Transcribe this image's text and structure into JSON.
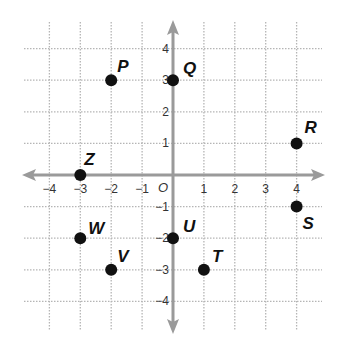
{
  "chart_data": {
    "type": "scatter",
    "title": "",
    "xlabel": "",
    "ylabel": "",
    "xlim": [
      -4,
      4
    ],
    "ylim": [
      -4,
      4
    ],
    "grid": true,
    "grid_style": "dotted",
    "origin_label": "O",
    "x_ticks": [
      -4,
      -3,
      -2,
      -1,
      1,
      2,
      3,
      4
    ],
    "x_tick_labels": [
      "−4",
      "−3",
      "−2",
      "−1",
      "1",
      "2",
      "3",
      "4"
    ],
    "y_ticks": [
      4,
      3,
      2,
      1,
      -1,
      -2,
      -3,
      -4
    ],
    "y_tick_labels": [
      "4",
      "3",
      "2",
      "1",
      "−1",
      "−2",
      "−3",
      "−4"
    ],
    "points": [
      {
        "label": "P",
        "x": -2,
        "y": 3,
        "label_dx": 6,
        "label_dy": -8
      },
      {
        "label": "Q",
        "x": 0,
        "y": 3,
        "label_dx": 10,
        "label_dy": -6
      },
      {
        "label": "R",
        "x": 4,
        "y": 1,
        "label_dx": 8,
        "label_dy": -10
      },
      {
        "label": "Z",
        "x": -3,
        "y": 0,
        "label_dx": 4,
        "label_dy": -10
      },
      {
        "label": "S",
        "x": 4,
        "y": -1,
        "label_dx": 6,
        "label_dy": 22
      },
      {
        "label": "W",
        "x": -3,
        "y": -2,
        "label_dx": 8,
        "label_dy": -4
      },
      {
        "label": "U",
        "x": 0,
        "y": -2,
        "label_dx": 10,
        "label_dy": -6
      },
      {
        "label": "V",
        "x": -2,
        "y": -3,
        "label_dx": 6,
        "label_dy": -8
      },
      {
        "label": "T",
        "x": 1,
        "y": -3,
        "label_dx": 8,
        "label_dy": -8
      }
    ]
  },
  "colors": {
    "axis": "#9a9a9a",
    "grid": "#b5b5b5",
    "point": "#111111",
    "background": "#ffffff"
  }
}
